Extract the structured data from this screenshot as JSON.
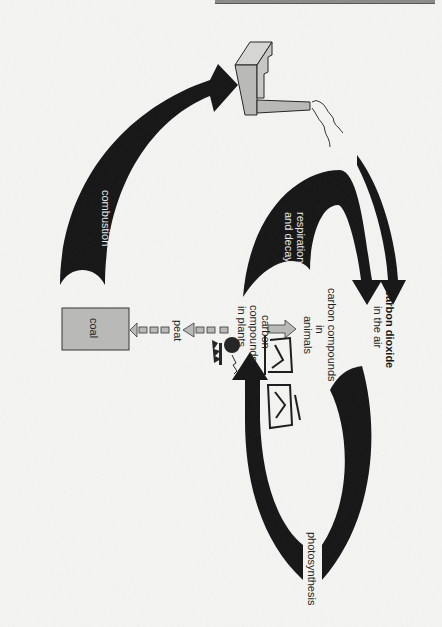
{
  "diagram": {
    "orientation": "rotated 90° clockwise",
    "labels": {
      "combustion": "combustion",
      "respiration_line1": "respiration",
      "respiration_line2": "and decay",
      "co2_line1": "carbon dioxide",
      "co2_line2": "in the air",
      "animals_line1": "carbon compounds",
      "animals_line2": "in",
      "animals_line3": "animals",
      "plants_line1": "carbon",
      "plants_line2": "compounds",
      "plants_line3": "in plants",
      "peat": "peat",
      "coal": "coal",
      "photosynthesis": "photosynthesis"
    },
    "icons": {
      "factory": "factory-icon",
      "smoke": "smoke-icon",
      "animals": "animals-icon",
      "plants": "plants-icon"
    },
    "colors": {
      "arrow": "#141414",
      "grey_fill": "#b9b9b7",
      "light_fill": "#d6d6d4",
      "background": "#f4f4f2"
    }
  }
}
